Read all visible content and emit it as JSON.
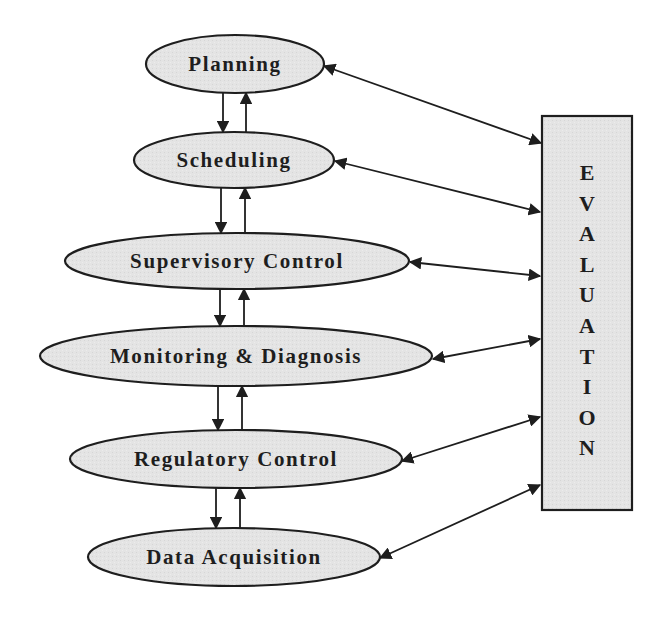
{
  "diagram": {
    "title": "",
    "colors": {
      "node_fill": "#e4e4e4",
      "stroke": "#1e1e1e",
      "background": "#ffffff",
      "evaluation_fill": "#e2e2e2"
    },
    "nodes": [
      {
        "id": "planning",
        "label": "Planning",
        "cx": 235,
        "cy": 64,
        "rx": 89,
        "ry": 29
      },
      {
        "id": "scheduling",
        "label": "Scheduling",
        "cx": 234,
        "cy": 160,
        "rx": 100,
        "ry": 28
      },
      {
        "id": "supervisory-control",
        "label": "Supervisory Control",
        "cx": 237,
        "cy": 261,
        "rx": 172,
        "ry": 28
      },
      {
        "id": "monitoring-diagnosis",
        "label": "Monitoring & Diagnosis",
        "cx": 236,
        "cy": 356,
        "rx": 196,
        "ry": 30
      },
      {
        "id": "regulatory-control",
        "label": "Regulatory Control",
        "cx": 236,
        "cy": 459,
        "rx": 166,
        "ry": 29
      },
      {
        "id": "data-acquisition",
        "label": "Data Acquisition",
        "cx": 234,
        "cy": 557,
        "rx": 146,
        "ry": 29
      }
    ],
    "evaluation": {
      "label": "EVALUATION",
      "letters": [
        "E",
        "V",
        "A",
        "L",
        "U",
        "A",
        "T",
        "I",
        "O",
        "N"
      ],
      "x": 542,
      "y": 116,
      "width": 90,
      "height": 394
    },
    "vertical_links": [
      {
        "from": "planning",
        "to": "scheduling",
        "down_x": 223,
        "up_x": 246
      },
      {
        "from": "scheduling",
        "to": "supervisory-control",
        "down_x": 221,
        "up_x": 245
      },
      {
        "from": "supervisory-control",
        "to": "monitoring-diagnosis",
        "down_x": 220,
        "up_x": 244
      },
      {
        "from": "monitoring-diagnosis",
        "to": "regulatory-control",
        "down_x": 218,
        "up_x": 242
      },
      {
        "from": "regulatory-control",
        "to": "data-acquisition",
        "down_x": 216,
        "up_x": 240
      }
    ],
    "evaluation_links": [
      {
        "node": "planning",
        "x1": 324,
        "y1": 66,
        "x2": 541,
        "y2": 143
      },
      {
        "node": "scheduling",
        "x1": 335,
        "y1": 161,
        "x2": 540,
        "y2": 212
      },
      {
        "node": "supervisory-control",
        "x1": 410,
        "y1": 262,
        "x2": 540,
        "y2": 276
      },
      {
        "node": "monitoring-diagnosis",
        "x1": 433,
        "y1": 359,
        "x2": 540,
        "y2": 339
      },
      {
        "node": "regulatory-control",
        "x1": 402,
        "y1": 461,
        "x2": 540,
        "y2": 417
      },
      {
        "node": "data-acquisition",
        "x1": 380,
        "y1": 558,
        "x2": 540,
        "y2": 485
      }
    ]
  }
}
